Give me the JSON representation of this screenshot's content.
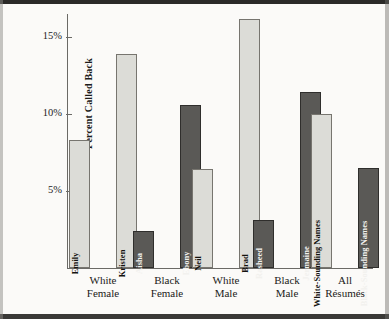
{
  "chart_data": {
    "type": "bar",
    "title": "",
    "subtitle": "",
    "xlabel": "",
    "ylabel": "Percent Called Back",
    "ylim": [
      0,
      17.5
    ],
    "grid": false,
    "legend": "none",
    "yticks": [
      {
        "value": 15,
        "label": "15%"
      },
      {
        "value": 10,
        "label": "10%"
      },
      {
        "value": 5,
        "label": "5%"
      }
    ],
    "categories": [
      "White Female",
      "Black Female",
      "White Male",
      "Black Male",
      "All Résumés"
    ],
    "category_lines": [
      [
        "White",
        "Female"
      ],
      [
        "Black",
        "Female"
      ],
      [
        "White",
        "Male"
      ],
      [
        "Black",
        "Male"
      ],
      [
        "All",
        "Résumés"
      ]
    ],
    "bars": [
      {
        "label": "Emily",
        "value": 8.3,
        "group": "White Female",
        "shade": "light"
      },
      {
        "label": "Kristen",
        "value": 13.9,
        "group": "White Female",
        "shade": "light"
      },
      {
        "label": "Aisha",
        "value": 2.4,
        "group": "Black Female",
        "shade": "dark"
      },
      {
        "label": "Ebony",
        "value": 10.6,
        "group": "Black Female",
        "shade": "dark"
      },
      {
        "label": "Neil",
        "value": 6.4,
        "group": "White Male",
        "shade": "light"
      },
      {
        "label": "Brad",
        "value": 16.2,
        "group": "White Male",
        "shade": "light"
      },
      {
        "label": "Rasheed",
        "value": 3.1,
        "group": "Black Male",
        "shade": "dark"
      },
      {
        "label": "Jermaine",
        "value": 11.4,
        "group": "Black Male",
        "shade": "dark"
      },
      {
        "label": "White-Sounding Names",
        "value": 10.0,
        "group": "All Résumés",
        "shade": "light"
      },
      {
        "label": "Black-Sounding Names",
        "value": 6.5,
        "group": "All Résumés",
        "shade": "dark"
      }
    ],
    "colors": {
      "light_fill": "#dcdcd7",
      "light_stroke": "#77756f",
      "dark_fill": "#5a5956",
      "dark_stroke": "#2f2e2c",
      "axis": "#6b6a66",
      "text": "#1b1a18",
      "background": "#fbfaf8"
    }
  }
}
